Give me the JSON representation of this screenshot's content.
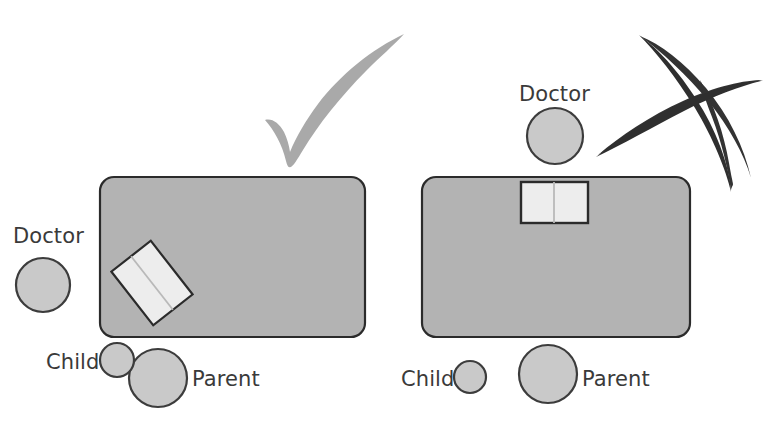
{
  "figure": {
    "background": "#ffffff",
    "width": 763,
    "height": 439
  },
  "palette": {
    "table_fill": "#b3b3b3",
    "table_stroke": "#2b2b2b",
    "person_fill": "#c9c9c9",
    "person_stroke": "#3c3c3c",
    "book_fill": "#ededed",
    "book_stroke": "#2b2b2b",
    "book_fold": "#b9b9b9",
    "check_color": "#a9a9a9",
    "cross_color": "#333333",
    "label_color": "#3a3a3a"
  },
  "panels": [
    {
      "id": "recommended",
      "verdict": {
        "icon": "check-mark-icon",
        "meaning": "recommended"
      },
      "table": {
        "name": "desk-table",
        "x": 100,
        "y": 177,
        "width": 265,
        "height": 160,
        "radius": 14
      },
      "book": {
        "name": "open-book",
        "cx": 152,
        "cy": 283,
        "width": 50,
        "height": 68,
        "rotation": -38
      },
      "people": [
        {
          "name": "doctor",
          "label": "Doctor",
          "cx": 43,
          "cy": 285,
          "r": 27,
          "label_x": 13,
          "label_y": 226
        },
        {
          "name": "child",
          "label": "Child",
          "cx": 117,
          "cy": 360,
          "r": 17,
          "label_x": 46,
          "label_y": 352
        },
        {
          "name": "parent",
          "label": "Parent",
          "cx": 158,
          "cy": 378,
          "r": 29,
          "label_x": 192,
          "label_y": 369
        }
      ]
    },
    {
      "id": "not-recommended",
      "verdict": {
        "icon": "cross-mark-icon",
        "meaning": "not recommended"
      },
      "table": {
        "name": "desk-table",
        "x": 422,
        "y": 177,
        "width": 268,
        "height": 160,
        "radius": 14
      },
      "book": {
        "name": "open-book",
        "cx": 554,
        "cy": 202,
        "width": 67,
        "height": 41,
        "rotation": 0
      },
      "people": [
        {
          "name": "doctor",
          "label": "Doctor",
          "cx": 555,
          "cy": 136,
          "r": 28,
          "label_x": 519,
          "label_y": 84
        },
        {
          "name": "child",
          "label": "Child",
          "cx": 470,
          "cy": 377,
          "r": 16,
          "label_x": 401,
          "label_y": 369
        },
        {
          "name": "parent",
          "label": "Parent",
          "cx": 548,
          "cy": 374,
          "r": 29,
          "label_x": 582,
          "label_y": 369
        }
      ]
    }
  ],
  "labels": {
    "doctor": "Doctor",
    "child": "Child",
    "parent": "Parent"
  }
}
